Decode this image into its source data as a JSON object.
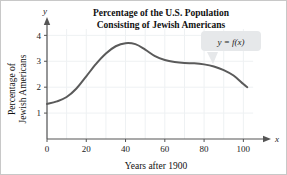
{
  "chart_data": {
    "type": "line",
    "title": "Percentage of the U.S. Population Consisting of Jewish Americans",
    "title_lines": [
      "Percentage of the U.S. Population",
      "Consisting of Jewish Americans"
    ],
    "xlabel": "Years after 1900",
    "ylabel": "Percentage of Jewish Americans",
    "ylabel_lines": [
      "Percentage of",
      "Jewish Americans"
    ],
    "x_axis_variable": "x",
    "y_axis_variable": "y",
    "xlim": [
      0,
      110
    ],
    "ylim": [
      0,
      4.4
    ],
    "xticks": [
      0,
      20,
      40,
      60,
      80,
      100
    ],
    "xtick_labels": [
      "0",
      "20",
      "40",
      "60",
      "80",
      "100"
    ],
    "yticks": [
      1,
      2,
      3,
      4
    ],
    "ytick_labels": [
      "1",
      "2",
      "3",
      "4"
    ],
    "grid": true,
    "grid_spacing_x": 10,
    "grid_spacing_y": 1,
    "legend": "none",
    "annotations": [
      {
        "name": "function-callout",
        "text": "y = f(x)",
        "points_to_x": 88,
        "points_to_y": 2.62
      }
    ],
    "series": [
      {
        "name": "f(x)",
        "color": "#5a5a5a",
        "x": [
          0,
          5,
          10,
          15,
          20,
          25,
          30,
          35,
          40,
          45,
          50,
          55,
          60,
          65,
          70,
          75,
          80,
          85,
          90,
          95,
          100,
          102
        ],
        "values": [
          1.35,
          1.45,
          1.62,
          1.95,
          2.42,
          2.9,
          3.3,
          3.58,
          3.7,
          3.66,
          3.45,
          3.2,
          3.05,
          2.97,
          2.93,
          2.92,
          2.88,
          2.8,
          2.66,
          2.45,
          2.12,
          2.0
        ]
      }
    ]
  },
  "colors": {
    "curve": "#5a5a5a",
    "axis": "#555555",
    "grid": "#eef1f3",
    "frame": "#c8c8c8",
    "callout_fill": "#e6e8ea",
    "text": "#111111"
  }
}
